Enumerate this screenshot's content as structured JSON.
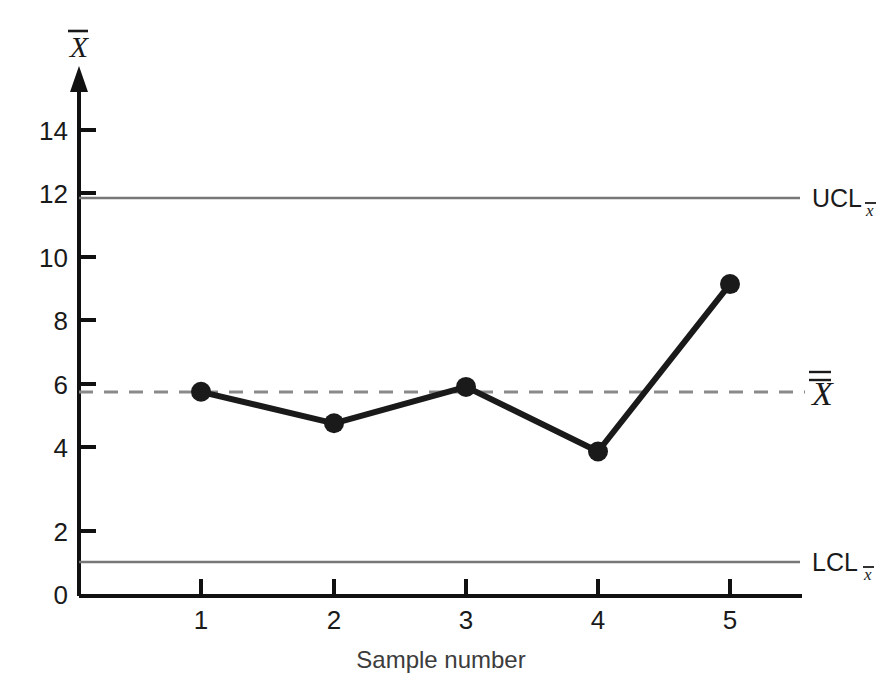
{
  "chart_data": {
    "type": "line",
    "title": "",
    "subtitle": "",
    "xlabel": "Sample number",
    "ylabel": "X̄",
    "ylabel_plain": "X-bar",
    "x": [
      1,
      2,
      3,
      4,
      5
    ],
    "categories": [
      "1",
      "2",
      "3",
      "4",
      "5"
    ],
    "series": [
      {
        "name": "Sample mean",
        "values": [
          6.1,
          5.15,
          6.25,
          4.3,
          9.35
        ],
        "marker": "filled-circle",
        "color": "#1a1a1a"
      }
    ],
    "xlim": [
      0.45,
      5.55
    ],
    "ylim": [
      0,
      15.1
    ],
    "xticks": [
      1,
      2,
      3,
      4,
      5
    ],
    "xticklabels": [
      "1",
      "2",
      "3",
      "4",
      "5"
    ],
    "yticks": [
      0,
      2,
      4,
      6,
      8,
      10,
      12,
      14
    ],
    "yticklabels": [
      "0",
      "2",
      "4",
      "6",
      "8",
      "10",
      "12",
      "14"
    ],
    "grid": false,
    "legend": "none",
    "reference_lines": [
      {
        "id": "ucl",
        "label": "UCL",
        "subscript": "x̄",
        "value": 11.85,
        "style": "solid",
        "color": "#777777"
      },
      {
        "id": "center",
        "label": "X̿",
        "subscript": "",
        "value": 6.05,
        "style": "dashed",
        "color": "#8a8a8a"
      },
      {
        "id": "lcl",
        "label": "LCL",
        "subscript": "x̄",
        "value": 1.05,
        "style": "solid",
        "color": "#777777"
      }
    ]
  },
  "axes": {
    "y_axis_label": "X",
    "y_axis_overbar": true,
    "x_axis_title": "Sample number",
    "y_tick_labels": [
      "14",
      "12",
      "10",
      "8",
      "6",
      "4",
      "2",
      "0"
    ],
    "x_tick_labels": [
      "1",
      "2",
      "3",
      "4",
      "5"
    ]
  },
  "limits": {
    "ucl_label": "UCL",
    "ucl_subscript": "x",
    "center_label": "X",
    "lcl_label": "LCL",
    "lcl_subscript": "x"
  },
  "colors": {
    "background": "#ffffff",
    "axis": "#111111",
    "data_line": "#1e1e1e",
    "marker": "#1a1a1a",
    "limit_line": "#777777",
    "center_line": "#8a8a8a",
    "text": "#1a1a1a",
    "muted_text": "#3c3c3c"
  }
}
